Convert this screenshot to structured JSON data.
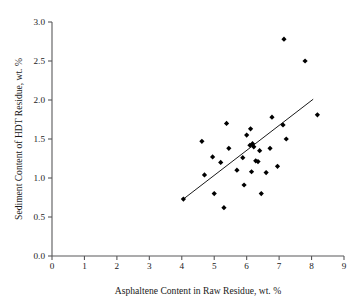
{
  "chart_data": {
    "type": "scatter",
    "title": "",
    "xlabel": "Asphaltene Content in Raw Residue, wt. %",
    "ylabel": "Sediment Content of HDT Residue, wt. %",
    "xlim": [
      0,
      9
    ],
    "ylim": [
      0.0,
      3.0
    ],
    "xticks": [
      "0",
      "1",
      "2",
      "3",
      "4",
      "5",
      "6",
      "7",
      "8",
      "9"
    ],
    "yticks": [
      "0.0",
      "0.5",
      "1.0",
      "1.5",
      "2.0",
      "2.5",
      "3.0"
    ],
    "xtick_values": [
      0,
      1,
      2,
      3,
      4,
      5,
      6,
      7,
      8,
      9
    ],
    "ytick_values": [
      0.0,
      0.5,
      1.0,
      1.5,
      2.0,
      2.5,
      3.0
    ],
    "grid": false,
    "legend": null,
    "marker": "diamond",
    "marker_color": "#000000",
    "series": [
      {
        "name": "Sediment vs Asphaltene",
        "points": [
          [
            4.05,
            0.73
          ],
          [
            4.62,
            1.47
          ],
          [
            4.7,
            1.04
          ],
          [
            4.95,
            1.27
          ],
          [
            5.0,
            0.8
          ],
          [
            5.2,
            1.2
          ],
          [
            5.3,
            0.62
          ],
          [
            5.38,
            1.7
          ],
          [
            5.45,
            1.38
          ],
          [
            5.7,
            1.1
          ],
          [
            5.88,
            1.26
          ],
          [
            5.92,
            0.91
          ],
          [
            6.0,
            1.55
          ],
          [
            6.1,
            1.42
          ],
          [
            6.12,
            1.63
          ],
          [
            6.15,
            1.08
          ],
          [
            6.18,
            1.44
          ],
          [
            6.22,
            1.4
          ],
          [
            6.28,
            1.22
          ],
          [
            6.35,
            1.21
          ],
          [
            6.4,
            1.35
          ],
          [
            6.45,
            0.8
          ],
          [
            6.6,
            1.07
          ],
          [
            6.72,
            1.38
          ],
          [
            6.78,
            1.78
          ],
          [
            6.95,
            1.15
          ],
          [
            7.12,
            1.68
          ],
          [
            7.15,
            2.78
          ],
          [
            7.22,
            1.5
          ],
          [
            7.8,
            2.5
          ],
          [
            8.18,
            1.81
          ]
        ]
      }
    ],
    "trend_line": {
      "name": "linear-fit",
      "x_start": 4.05,
      "y_start": 0.73,
      "x_end": 8.05,
      "y_end": 2.01
    }
  }
}
